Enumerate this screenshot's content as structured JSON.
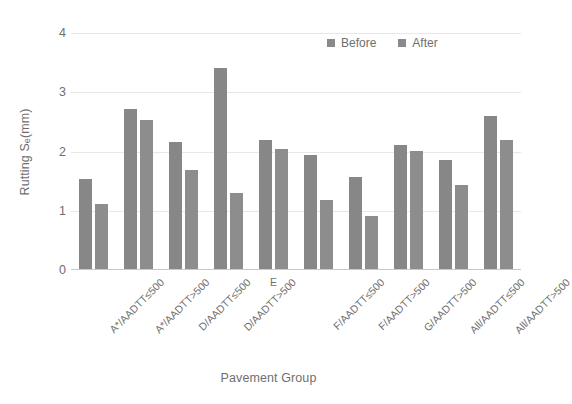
{
  "chart_data": {
    "type": "bar",
    "title": "",
    "xlabel": "Pavement Group",
    "ylabel": "Rutting S",
    "ylabel_sub": "e",
    "ylabel_units": " (mm)",
    "ylim": [
      0,
      4
    ],
    "yticks": [
      0,
      1,
      2,
      3,
      4
    ],
    "ytick_labels": [
      "0",
      "1",
      "2",
      "3",
      "4"
    ],
    "grid": true,
    "grid_axis": "y",
    "legend_position": "top-right",
    "categories": [
      "A*/AADTT≤500",
      "A*/AADTT>500",
      "D/AADTT≤500",
      "D/AADTT>500",
      "E",
      "F/AADTT≤500",
      "F/AADTT>500",
      "G/AADTT>500",
      "All/AADTT≤500",
      "All/AADTT>500"
    ],
    "series": [
      {
        "name": "Before",
        "color": "#878787",
        "values": [
          1.52,
          2.71,
          2.16,
          3.41,
          2.18,
          1.94,
          1.56,
          2.11,
          1.85,
          2.59
        ]
      },
      {
        "name": "After",
        "color": "#8d8d8d",
        "values": [
          1.11,
          2.52,
          1.68,
          1.28,
          2.04,
          1.17,
          0.9,
          2.0,
          1.43,
          2.19
        ]
      }
    ]
  },
  "legend": {
    "items": [
      {
        "label": "Before"
      },
      {
        "label": "After"
      }
    ]
  },
  "colors": {
    "bar_before": "#878787",
    "bar_after": "#8d8d8d",
    "text": "#6f6f6f",
    "gridline": "#e8e8e8",
    "axis": "#c9c9c9",
    "background": "#ffffff"
  }
}
